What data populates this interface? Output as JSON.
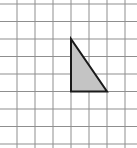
{
  "diagram": {
    "type": "grid-with-shape",
    "width": 137,
    "height": 148,
    "background": "#ffffff",
    "grid": {
      "line_color": "#8f8f8f",
      "line_width": 1,
      "vertical_x": [
        17,
        35,
        53,
        71,
        89,
        107,
        125
      ],
      "horizontal_y": [
        4,
        21.5,
        39,
        56.5,
        74,
        91.5,
        109,
        126.5,
        144
      ]
    },
    "shape": {
      "name": "right-triangle",
      "fill": "#c4c4c4",
      "stroke": "#1a1a1a",
      "stroke_width": 2,
      "vertices": [
        [
          71,
          39
        ],
        [
          71,
          91.5
        ],
        [
          107,
          91.5
        ]
      ],
      "grid_units": {
        "leg_vertical": 3,
        "leg_horizontal": 2
      }
    }
  }
}
